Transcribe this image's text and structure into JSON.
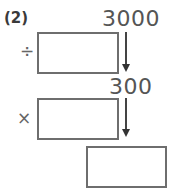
{
  "problem": {
    "label": "(2)",
    "start_value": "3000",
    "middle_value": "300",
    "step1_operator": "÷",
    "step2_operator": "×",
    "boxes": [
      {
        "id": "divisor-box",
        "value": ""
      },
      {
        "id": "multiplier-box",
        "value": ""
      },
      {
        "id": "result-box",
        "value": ""
      }
    ]
  }
}
